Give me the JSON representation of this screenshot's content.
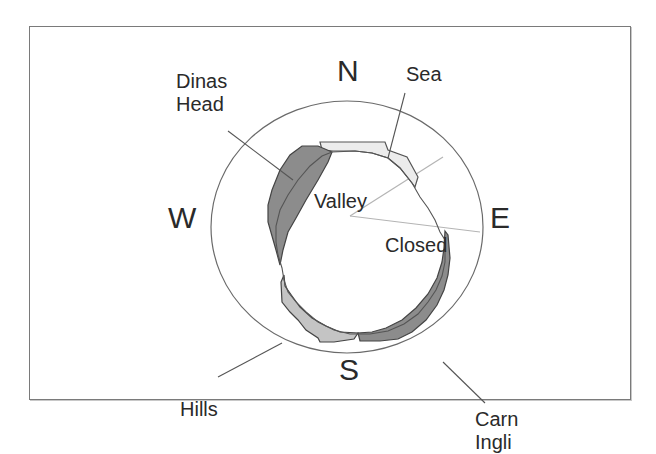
{
  "diagram": {
    "type": "horizon-compass-sketch",
    "compass": {
      "north": "N",
      "south": "S",
      "east": "E",
      "west": "W"
    },
    "regions": [
      {
        "id": "dinas-head",
        "label": "Dinas\nHead",
        "fill": "#8c8c8c"
      },
      {
        "id": "sea",
        "label": "Sea",
        "fill": "#ececec"
      },
      {
        "id": "valley",
        "label": "Valley",
        "fill": "#ffffff"
      },
      {
        "id": "closed",
        "label": "Closed",
        "fill": "#ffffff"
      },
      {
        "id": "carn-ingli",
        "label": "Carn\nIngli",
        "fill": "#8c8c8c"
      },
      {
        "id": "hills",
        "label": "Hills",
        "fill": "#c4c4c4"
      }
    ],
    "colors": {
      "outline": "#555555",
      "ray": "#b4b4b4",
      "frame": "#7a7a7a",
      "text": "#2a2a2a"
    }
  }
}
